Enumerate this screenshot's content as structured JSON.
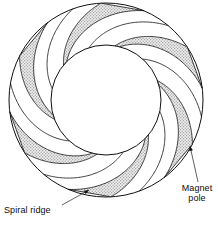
{
  "figure": {
    "kind": "technical-line-diagram",
    "background_color": "#ffffff",
    "ink_color": "#101010",
    "shade_color": "#c9c9c9",
    "shade_dot_color": "#8c8c8c",
    "width": 218,
    "height": 228
  },
  "geometry": {
    "center_x": 106,
    "center_y": 100,
    "outer_radius": 97,
    "inner_radius": 55,
    "ridge_count": 6,
    "spiral_turn_degrees": 58,
    "ridge_angular_width_outer_degrees": 26,
    "ridge_angular_width_inner_degrees": 5,
    "pole_rim_stroke_width": 1.0,
    "ridge_stroke_width": 0.8,
    "start_angle_offset_degrees": -18,
    "spiral_direction": "counterclockwise-outward"
  },
  "labels": [
    {
      "id": "spiral-ridge",
      "lines": [
        "Spiral ridge"
      ],
      "leader": {
        "from_x": 62,
        "from_y": 205,
        "to_x": 89,
        "to_y": 190,
        "arrow": true
      }
    },
    {
      "id": "magnet-pole",
      "lines": [
        "Magnet",
        "pole"
      ],
      "leader": {
        "from_x": 198,
        "from_y": 182,
        "to_x": 190,
        "to_y": 146,
        "arrow": true
      }
    }
  ],
  "annotations": {
    "spiral_ridge_label": "Spiral ridge",
    "magnet_pole_label_line1": "Magnet",
    "magnet_pole_label_line2": "pole"
  }
}
